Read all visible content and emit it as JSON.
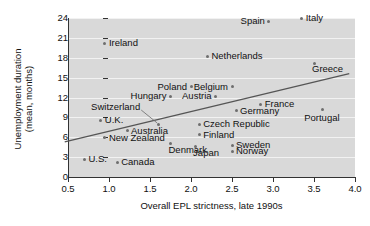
{
  "chart_data": {
    "type": "scatter",
    "title": "",
    "xlabel": "Overall EPL strictness, late 1990s",
    "ylabel": "Unemployment duration\n(mean, months)",
    "ylabel_line1": "Unemployment duration",
    "ylabel_line2": "(mean, months)",
    "xlim": [
      0.5,
      4.0
    ],
    "ylim": [
      0,
      24
    ],
    "xticks": [
      "0.5",
      "1.0",
      "1.5",
      "2.0",
      "2.5",
      "3.0",
      "3.5",
      "4.0"
    ],
    "xtick_values": [
      0.5,
      1.0,
      1.5,
      2.0,
      2.5,
      3.0,
      3.5,
      4.0
    ],
    "yticks": [
      "0",
      "3",
      "6",
      "9",
      "12",
      "15",
      "18",
      "21",
      "24"
    ],
    "ytick_values": [
      0,
      3,
      6,
      9,
      12,
      15,
      18,
      21,
      24
    ],
    "grid": "horizontal",
    "legend": "none",
    "plot_background": "#d9d9d9",
    "marker_color": "#6e6e6e",
    "trendline_color": "#555555",
    "trendline": {
      "x0": 0.46,
      "y0": 5.3,
      "x1": 3.93,
      "y1": 15.6,
      "note": "upward sloping fitted line"
    },
    "points": [
      {
        "label": "Spain",
        "x": 2.95,
        "y": 23.5,
        "label_pos": "left"
      },
      {
        "label": "Italy",
        "x": 3.35,
        "y": 24.0,
        "label_pos": "right"
      },
      {
        "label": "Ireland",
        "x": 0.95,
        "y": 20.2,
        "label_pos": "right"
      },
      {
        "label": "Netherlands",
        "x": 2.2,
        "y": 18.2,
        "label_pos": "right"
      },
      {
        "label": "Greece",
        "x": 3.5,
        "y": 17.2,
        "label_pos": "above"
      },
      {
        "label": "Poland",
        "x": 2.0,
        "y": 13.6,
        "label_pos": "left"
      },
      {
        "label": "Belgium",
        "x": 2.5,
        "y": 13.6,
        "label_pos": "left"
      },
      {
        "label": "Hungary",
        "x": 1.75,
        "y": 12.2,
        "label_pos": "left"
      },
      {
        "label": "Austria",
        "x": 2.3,
        "y": 12.2,
        "label_pos": "left"
      },
      {
        "label": "France",
        "x": 2.85,
        "y": 11.0,
        "label_pos": "right"
      },
      {
        "label": "Germany",
        "x": 2.55,
        "y": 10.0,
        "label_pos": "right"
      },
      {
        "label": "Portugal",
        "x": 3.6,
        "y": 10.2,
        "label_pos": "below"
      },
      {
        "label": "Switzerland",
        "x": 1.6,
        "y": 8.0,
        "label_pos": "leader"
      },
      {
        "label": "U.K.",
        "x": 0.9,
        "y": 8.6,
        "label_pos": "right"
      },
      {
        "label": "Czech Republic",
        "x": 2.1,
        "y": 8.0,
        "label_pos": "right"
      },
      {
        "label": "Australia",
        "x": 1.22,
        "y": 7.0,
        "label_pos": "right"
      },
      {
        "label": "Finland",
        "x": 2.1,
        "y": 6.4,
        "label_pos": "right"
      },
      {
        "label": "New Zealand",
        "x": 0.95,
        "y": 5.9,
        "label_pos": "right"
      },
      {
        "label": "Denmark",
        "x": 1.75,
        "y": 5.0,
        "label_pos": "above"
      },
      {
        "label": "Japan",
        "x": 2.05,
        "y": 4.6,
        "label_pos": "above"
      },
      {
        "label": "Sweden",
        "x": 2.5,
        "y": 4.8,
        "label_pos": "right"
      },
      {
        "label": "Norway",
        "x": 2.5,
        "y": 3.9,
        "label_pos": "right"
      },
      {
        "label": "U.S.",
        "x": 0.7,
        "y": 2.7,
        "label_pos": "right"
      },
      {
        "label": "Canada",
        "x": 1.1,
        "y": 2.2,
        "label_pos": "right"
      }
    ]
  }
}
